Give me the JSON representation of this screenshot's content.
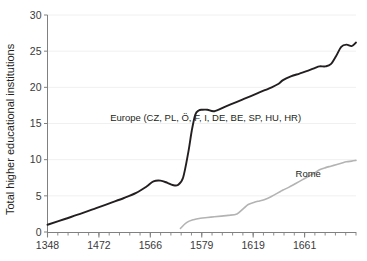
{
  "chart_data": {
    "type": "line",
    "title": "",
    "xlabel": "",
    "ylabel": "Total higher educational institutions",
    "xlim": [
      1348,
      1703
    ],
    "ylim": [
      0,
      30
    ],
    "grid": true,
    "legend_position": "inline-annotations",
    "xticklabels": [
      "1348",
      "1472",
      "1566",
      "1579",
      "1619",
      "1661"
    ],
    "xtickvalues": [
      1348,
      1472,
      1566,
      1579,
      1619,
      1661
    ],
    "yticklabels": [
      "0",
      "5",
      "10",
      "15",
      "20",
      "25",
      "30"
    ],
    "ytickvalues": [
      0,
      5,
      10,
      15,
      20,
      25,
      30
    ],
    "minor_tick_count": 30,
    "series": [
      {
        "name": "Europe (CZ, PL, Ö, F, I, DE, BE, SP, HU, HR)",
        "color": "#231f20",
        "x": [
          1348,
          1368,
          1388,
          1404,
          1420,
          1436,
          1450,
          1462,
          1470,
          1478,
          1486,
          1492,
          1498,
          1504,
          1510,
          1514,
          1518,
          1522,
          1526,
          1532,
          1540,
          1552,
          1566,
          1574,
          1582,
          1590,
          1598,
          1606,
          1614,
          1619,
          1628,
          1638,
          1648,
          1656,
          1661,
          1668,
          1674,
          1680,
          1686,
          1692,
          1698,
          1703
        ],
        "y": [
          1.0,
          1.8,
          2.6,
          3.3,
          4.0,
          4.7,
          5.4,
          6.3,
          7.0,
          7.1,
          6.8,
          6.5,
          6.5,
          7.5,
          11.0,
          14.0,
          16.2,
          16.8,
          16.9,
          16.9,
          16.7,
          17.3,
          18.0,
          18.4,
          18.8,
          19.2,
          19.6,
          20.0,
          20.5,
          21.0,
          21.5,
          21.9,
          22.3,
          22.7,
          22.9,
          22.9,
          23.2,
          24.3,
          25.6,
          25.9,
          25.7,
          26.2
        ],
        "label": "Europe (CZ, PL, Ö, F, I, DE, BE, SP, HU, HR)",
        "label_x": 1530,
        "label_y": 15.4
      },
      {
        "name": "Rome",
        "color": "#b3b3b3",
        "x": [
          1501,
          1508,
          1516,
          1524,
          1532,
          1540,
          1548,
          1556,
          1566,
          1574,
          1579,
          1586,
          1592,
          1598,
          1604,
          1610,
          1616,
          1619,
          1626,
          1632,
          1638,
          1644,
          1650,
          1656,
          1661,
          1668,
          1674,
          1680,
          1686,
          1692,
          1698,
          1703
        ],
        "y": [
          0.5,
          1.3,
          1.7,
          1.9,
          2.0,
          2.1,
          2.2,
          2.3,
          2.5,
          3.3,
          3.8,
          4.1,
          4.3,
          4.5,
          4.8,
          5.2,
          5.6,
          5.8,
          6.2,
          6.6,
          7.0,
          7.4,
          7.8,
          8.2,
          8.6,
          8.9,
          9.1,
          9.3,
          9.5,
          9.7,
          9.8,
          9.9
        ],
        "label": "Rome",
        "label_x": 1648,
        "label_y": 7.6
      }
    ]
  },
  "axes": {
    "y_title": "Total higher educational institutions",
    "y_ticks": [
      "30",
      "25",
      "20",
      "15",
      "10",
      "5",
      "0"
    ],
    "x_ticks": [
      "1348",
      "1472",
      "1566",
      "1579",
      "1619",
      "1661"
    ]
  },
  "annotations": {
    "europe_label": "Europe (CZ, PL, Ö, F, I, DE, BE, SP, HU, HR)",
    "rome_label": "Rome"
  },
  "colors": {
    "europe_line": "#231f20",
    "rome_line": "#b3b3b3",
    "axis": "#808080",
    "grid": "#f0f0f0",
    "text": "#231f20",
    "background": "#ffffff"
  }
}
